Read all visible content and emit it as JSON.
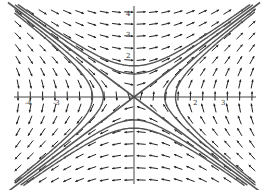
{
  "chart_data": {
    "type": "vector_field",
    "title": "",
    "system": {
      "dx": "y",
      "dy": "x"
    },
    "xlim": [
      -4.3,
      4.1
    ],
    "ylim": [
      -4.0,
      4.0
    ],
    "grid": false,
    "x_ticks": [
      {
        "value": -4,
        "label": "-4"
      },
      {
        "value": -3,
        "label": "-3"
      },
      {
        "value": 2,
        "label": "2"
      },
      {
        "value": 3,
        "label": "3"
      }
    ],
    "y_ticks": [
      {
        "value": 4,
        "label": "4"
      },
      {
        "value": 3,
        "label": "3"
      },
      {
        "value": 2,
        "label": "2"
      }
    ],
    "arrow_columns": 20,
    "arrow_rows": 15,
    "separatrices": [
      {
        "slope": 1
      },
      {
        "slope": -1
      }
    ],
    "trajectories": [
      {
        "family": "x^2 - y^2 = c",
        "c": 1.2
      },
      {
        "family": "x^2 - y^2 = c",
        "c": 2.2
      },
      {
        "family": "x^2 - y^2 = c",
        "c": -1.2
      },
      {
        "family": "x^2 - y^2 = c",
        "c": -2.2
      }
    ],
    "colors": {
      "arrow": "#222222",
      "curve": "#555555",
      "axis": "#444444"
    }
  },
  "layout": {
    "origin_px": [
      134,
      97
    ],
    "scale_x_px": 28,
    "scale_y_px": 21,
    "field_left": 18,
    "field_right": 252,
    "field_top": 12,
    "field_bottom": 180
  }
}
